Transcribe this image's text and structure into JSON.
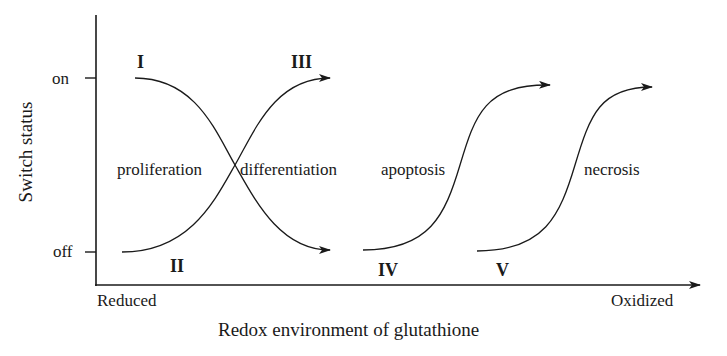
{
  "diagram": {
    "y_axis": {
      "label": "Switch status",
      "ticks": [
        "on",
        "off"
      ]
    },
    "x_axis": {
      "label": "Redox environment of glutathione",
      "left_end": "Reduced",
      "right_end": "Oxidized"
    },
    "curves": [
      {
        "id": "I",
        "direction": "on-to-off"
      },
      {
        "id": "II",
        "direction": "off-to-on"
      },
      {
        "id": "III",
        "direction": "arrow-end-on"
      },
      {
        "id": "IV",
        "direction": "off-to-on"
      },
      {
        "id": "V",
        "direction": "off-to-on"
      }
    ],
    "states": [
      "proliferation",
      "differentiation",
      "apoptosis",
      "necrosis"
    ],
    "colors": {
      "line": "#1a1a1a",
      "background": "#ffffff"
    }
  }
}
